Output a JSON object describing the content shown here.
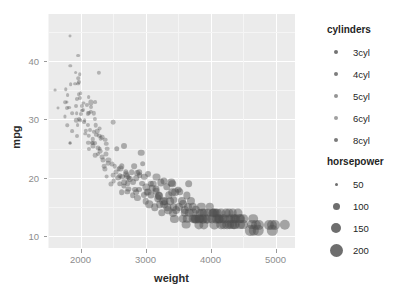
{
  "chart_data": {
    "type": "scatter",
    "title": "",
    "xlabel": "weight",
    "ylabel": "mpg",
    "xlim": [
      1500,
      5300
    ],
    "ylim": [
      8,
      48
    ],
    "xticks": [
      2000,
      3000,
      4000,
      5000
    ],
    "yticks": [
      10,
      20,
      30,
      40
    ],
    "grid": true,
    "panel_background": "#ebebeb",
    "gridline_color": "#ffffff",
    "point_color": "#505050",
    "point_opacity": 0.42,
    "legends": [
      {
        "title": "cylinders",
        "position": "right-top",
        "encoding": "color",
        "entries": [
          {
            "label": "3cyl",
            "color": "#737373",
            "size": 4
          },
          {
            "label": "4cyl",
            "color": "#7d7d7d",
            "size": 4
          },
          {
            "label": "5cyl",
            "color": "#949494",
            "size": 4
          },
          {
            "label": "6cyl",
            "color": "#a0a0a0",
            "size": 4
          },
          {
            "label": "8cyl",
            "color": "#7a7a7a",
            "size": 4
          }
        ]
      },
      {
        "title": "horsepower",
        "position": "right-bottom",
        "encoding": "size",
        "entries": [
          {
            "label": "50",
            "value": 50,
            "size": 3
          },
          {
            "label": "100",
            "value": 100,
            "size": 7
          },
          {
            "label": "150",
            "value": 150,
            "size": 10
          },
          {
            "label": "200",
            "value": 200,
            "size": 13
          }
        ]
      }
    ],
    "points": [
      [
        1613,
        35.0,
        4,
        46
      ],
      [
        1649,
        32.0,
        4,
        48
      ],
      [
        1755,
        30.5,
        4,
        52
      ],
      [
        1760,
        32.9,
        4,
        65
      ],
      [
        1773,
        35.1,
        4,
        60
      ],
      [
        1795,
        33.0,
        4,
        53
      ],
      [
        1795,
        31.9,
        4,
        71
      ],
      [
        1800,
        34.1,
        4,
        68
      ],
      [
        1825,
        32.0,
        4,
        67
      ],
      [
        1834,
        26.0,
        4,
        46
      ],
      [
        1835,
        26.0,
        4,
        46
      ],
      [
        1835,
        44.3,
        4,
        48
      ],
      [
        1845,
        39.1,
        4,
        58
      ],
      [
        1850,
        36.0,
        4,
        66
      ],
      [
        1867,
        31.0,
        4,
        65
      ],
      [
        1875,
        28.0,
        4,
        67
      ],
      [
        1915,
        36.1,
        4,
        66
      ],
      [
        1925,
        38.0,
        4,
        67
      ],
      [
        1937,
        32.2,
        4,
        70
      ],
      [
        1940,
        31.0,
        4,
        65
      ],
      [
        1945,
        33.5,
        4,
        75
      ],
      [
        1950,
        27.2,
        4,
        71
      ],
      [
        1955,
        29.0,
        4,
        68
      ],
      [
        1963,
        36.1,
        4,
        66
      ],
      [
        1965,
        40.9,
        4,
        67
      ],
      [
        1968,
        37.0,
        4,
        62
      ],
      [
        1970,
        34.3,
        4,
        65
      ],
      [
        1975,
        36.4,
        5,
        77
      ],
      [
        1980,
        30.0,
        4,
        68
      ],
      [
        1985,
        33.7,
        4,
        75
      ],
      [
        1990,
        37.7,
        4,
        62
      ],
      [
        1995,
        29.8,
        4,
        62
      ],
      [
        2000,
        34.5,
        4,
        65
      ],
      [
        2003,
        30.9,
        4,
        75
      ],
      [
        2019,
        32.3,
        4,
        75
      ],
      [
        2025,
        31.5,
        4,
        71
      ],
      [
        2035,
        31.6,
        4,
        74
      ],
      [
        2045,
        32.8,
        4,
        52
      ],
      [
        2050,
        29.5,
        4,
        68
      ],
      [
        2065,
        29.8,
        4,
        65
      ],
      [
        2075,
        27.5,
        4,
        60
      ],
      [
        2085,
        28.0,
        4,
        79
      ],
      [
        2100,
        32.4,
        4,
        75
      ],
      [
        2110,
        31.0,
        4,
        76
      ],
      [
        2120,
        29.0,
        4,
        75
      ],
      [
        2123,
        26.0,
        4,
        78
      ],
      [
        2124,
        25.0,
        4,
        75
      ],
      [
        2125,
        33.8,
        4,
        67
      ],
      [
        2130,
        27.2,
        4,
        84
      ],
      [
        2144,
        28.1,
        4,
        71
      ],
      [
        2155,
        31.3,
        4,
        80
      ],
      [
        2158,
        32.1,
        4,
        70
      ],
      [
        2164,
        32.9,
        4,
        100
      ],
      [
        2171,
        26.0,
        4,
        70
      ],
      [
        2188,
        26.0,
        4,
        72
      ],
      [
        2190,
        25.4,
        4,
        96
      ],
      [
        2200,
        27.9,
        4,
        78
      ],
      [
        2205,
        31.0,
        4,
        80
      ],
      [
        2219,
        30.0,
        4,
        76
      ],
      [
        2228,
        26.0,
        4,
        69
      ],
      [
        2230,
        23.9,
        4,
        86
      ],
      [
        2234,
        29.0,
        4,
        85
      ],
      [
        2245,
        27.4,
        4,
        80
      ],
      [
        2254,
        28.0,
        4,
        86
      ],
      [
        2264,
        25.1,
        4,
        92
      ],
      [
        2265,
        24.0,
        4,
        70
      ],
      [
        2278,
        38.0,
        4,
        78
      ],
      [
        2288,
        27.2,
        4,
        84
      ],
      [
        2295,
        25.0,
        4,
        87
      ],
      [
        2300,
        24.5,
        4,
        88
      ],
      [
        2310,
        26.8,
        4,
        88
      ],
      [
        2330,
        27.0,
        4,
        88
      ],
      [
        2335,
        23.6,
        4,
        90
      ],
      [
        2350,
        23.0,
        4,
        95
      ],
      [
        2360,
        22.0,
        4,
        88
      ],
      [
        2375,
        21.5,
        4,
        100
      ],
      [
        2379,
        26.5,
        4,
        88
      ],
      [
        2385,
        24.0,
        4,
        95
      ],
      [
        2395,
        25.8,
        4,
        83
      ],
      [
        2403,
        20.2,
        4,
        90
      ],
      [
        2408,
        25.0,
        4,
        87
      ],
      [
        2420,
        22.5,
        4,
        88
      ],
      [
        2430,
        23.0,
        4,
        97
      ],
      [
        2464,
        19.0,
        4,
        97
      ],
      [
        2490,
        22.3,
        4,
        95
      ],
      [
        2500,
        20.5,
        4,
        88
      ],
      [
        2506,
        29.5,
        4,
        88
      ],
      [
        2510,
        19.4,
        4,
        90
      ],
      [
        2525,
        22.0,
        4,
        85
      ],
      [
        2545,
        21.0,
        4,
        95
      ],
      [
        2560,
        25.0,
        6,
        105
      ],
      [
        2575,
        20.0,
        6,
        110
      ],
      [
        2585,
        21.5,
        4,
        90
      ],
      [
        2600,
        19.0,
        6,
        105
      ],
      [
        2605,
        20.3,
        5,
        103
      ],
      [
        2615,
        21.6,
        4,
        98
      ],
      [
        2634,
        17.5,
        6,
        110
      ],
      [
        2640,
        20.2,
        6,
        108
      ],
      [
        2665,
        25.4,
        6,
        116
      ],
      [
        2670,
        18.6,
        6,
        100
      ],
      [
        2672,
        19.2,
        6,
        105
      ],
      [
        2694,
        21.0,
        6,
        102
      ],
      [
        2700,
        20.6,
        6,
        108
      ],
      [
        2720,
        17.6,
        6,
        105
      ],
      [
        2725,
        19.1,
        6,
        110
      ],
      [
        2735,
        18.1,
        6,
        100
      ],
      [
        2740,
        20.0,
        6,
        110
      ],
      [
        2755,
        19.8,
        6,
        120
      ],
      [
        2789,
        21.0,
        6,
        110
      ],
      [
        2800,
        17.0,
        6,
        110
      ],
      [
        2807,
        19.2,
        6,
        115
      ],
      [
        2830,
        22.0,
        6,
        110
      ],
      [
        2835,
        18.0,
        6,
        115
      ],
      [
        2855,
        17.5,
        6,
        110
      ],
      [
        2860,
        19.9,
        6,
        110
      ],
      [
        2868,
        20.8,
        6,
        112
      ],
      [
        2875,
        16.5,
        6,
        120
      ],
      [
        2900,
        18.0,
        6,
        116
      ],
      [
        2904,
        21.0,
        6,
        110
      ],
      [
        2910,
        20.5,
        6,
        110
      ],
      [
        2933,
        24.3,
        6,
        130
      ],
      [
        2945,
        19.0,
        6,
        112
      ],
      [
        2957,
        22.4,
        6,
        110
      ],
      [
        2979,
        17.0,
        6,
        120
      ],
      [
        2984,
        20.2,
        6,
        125
      ],
      [
        3000,
        16.0,
        6,
        130
      ],
      [
        3012,
        18.5,
        6,
        145
      ],
      [
        3021,
        17.5,
        6,
        130
      ],
      [
        3035,
        20.6,
        6,
        115
      ],
      [
        3039,
        17.6,
        6,
        140
      ],
      [
        3060,
        15.5,
        8,
        150
      ],
      [
        3085,
        17.0,
        8,
        140
      ],
      [
        3102,
        18.2,
        6,
        130
      ],
      [
        3121,
        19.0,
        6,
        132
      ],
      [
        3139,
        15.0,
        8,
        150
      ],
      [
        3155,
        18.1,
        8,
        139
      ],
      [
        3169,
        20.2,
        6,
        140
      ],
      [
        3193,
        16.5,
        8,
        150
      ],
      [
        3205,
        17.0,
        8,
        145
      ],
      [
        3210,
        16.9,
        8,
        158
      ],
      [
        3221,
        15.5,
        8,
        150
      ],
      [
        3233,
        19.2,
        8,
        145
      ],
      [
        3250,
        14.0,
        8,
        150
      ],
      [
        3270,
        16.0,
        8,
        150
      ],
      [
        3278,
        19.4,
        8,
        140
      ],
      [
        3288,
        15.5,
        8,
        155
      ],
      [
        3302,
        16.0,
        8,
        148
      ],
      [
        3329,
        18.5,
        8,
        150
      ],
      [
        3336,
        15.0,
        8,
        150
      ],
      [
        3353,
        14.5,
        8,
        153
      ],
      [
        3360,
        17.0,
        8,
        150
      ],
      [
        3380,
        16.0,
        8,
        155
      ],
      [
        3399,
        19.2,
        8,
        145
      ],
      [
        3410,
        17.5,
        8,
        150
      ],
      [
        3425,
        14.0,
        8,
        160
      ],
      [
        3432,
        15.0,
        8,
        160
      ],
      [
        3439,
        16.2,
        8,
        150
      ],
      [
        3445,
        13.0,
        8,
        165
      ],
      [
        3459,
        17.5,
        8,
        155
      ],
      [
        3465,
        14.5,
        8,
        160
      ],
      [
        3504,
        18.0,
        8,
        130
      ],
      [
        3520,
        15.0,
        8,
        165
      ],
      [
        3530,
        17.6,
        8,
        150
      ],
      [
        3563,
        16.0,
        8,
        165
      ],
      [
        3570,
        13.0,
        8,
        170
      ],
      [
        3574,
        15.5,
        8,
        160
      ],
      [
        3609,
        14.0,
        8,
        170
      ],
      [
        3613,
        14.5,
        8,
        165
      ],
      [
        3620,
        12.0,
        8,
        180
      ],
      [
        3632,
        17.0,
        8,
        145
      ],
      [
        3645,
        13.0,
        8,
        175
      ],
      [
        3651,
        15.0,
        8,
        160
      ],
      [
        3664,
        19.0,
        8,
        155
      ],
      [
        3672,
        14.0,
        8,
        175
      ],
      [
        3693,
        16.0,
        8,
        165
      ],
      [
        3725,
        15.0,
        8,
        170
      ],
      [
        3730,
        13.0,
        8,
        175
      ],
      [
        3735,
        14.0,
        8,
        170
      ],
      [
        3755,
        13.0,
        8,
        180
      ],
      [
        3761,
        13.0,
        8,
        175
      ],
      [
        3777,
        14.5,
        8,
        170
      ],
      [
        3781,
        13.0,
        8,
        180
      ],
      [
        3820,
        12.0,
        8,
        190
      ],
      [
        3830,
        13.0,
        8,
        170
      ],
      [
        3840,
        14.0,
        8,
        165
      ],
      [
        3850,
        13.0,
        8,
        175
      ],
      [
        3860,
        15.0,
        8,
        170
      ],
      [
        3870,
        14.0,
        8,
        175
      ],
      [
        3880,
        13.0,
        8,
        180
      ],
      [
        3892,
        13.0,
        8,
        180
      ],
      [
        3900,
        12.0,
        8,
        190
      ],
      [
        3907,
        14.0,
        8,
        175
      ],
      [
        3940,
        13.0,
        8,
        180
      ],
      [
        3955,
        14.0,
        8,
        175
      ],
      [
        3962,
        13.0,
        8,
        180
      ],
      [
        3988,
        15.0,
        8,
        170
      ],
      [
        4020,
        13.0,
        8,
        190
      ],
      [
        4034,
        14.0,
        8,
        175
      ],
      [
        4042,
        14.0,
        8,
        180
      ],
      [
        4054,
        14.0,
        8,
        175
      ],
      [
        4060,
        12.0,
        8,
        190
      ],
      [
        4077,
        14.0,
        8,
        180
      ],
      [
        4080,
        13.0,
        8,
        185
      ],
      [
        4096,
        13.0,
        8,
        190
      ],
      [
        4100,
        14.0,
        8,
        175
      ],
      [
        4129,
        13.0,
        8,
        190
      ],
      [
        4135,
        13.0,
        8,
        190
      ],
      [
        4140,
        13.0,
        8,
        190
      ],
      [
        4154,
        14.0,
        8,
        185
      ],
      [
        4165,
        12.0,
        8,
        200
      ],
      [
        4190,
        13.0,
        8,
        195
      ],
      [
        4209,
        12.0,
        8,
        200
      ],
      [
        4215,
        13.0,
        8,
        190
      ],
      [
        4237,
        14.0,
        8,
        180
      ],
      [
        4257,
        12.0,
        8,
        200
      ],
      [
        4274,
        13.0,
        8,
        190
      ],
      [
        4278,
        14.0,
        8,
        185
      ],
      [
        4294,
        12.0,
        8,
        200
      ],
      [
        4312,
        13.0,
        8,
        195
      ],
      [
        4325,
        12.0,
        8,
        205
      ],
      [
        4341,
        14.0,
        8,
        180
      ],
      [
        4354,
        13.0,
        8,
        198
      ],
      [
        4363,
        12.0,
        8,
        200
      ],
      [
        4376,
        13.0,
        8,
        190
      ],
      [
        4380,
        12.0,
        8,
        205
      ],
      [
        4385,
        13.0,
        8,
        195
      ],
      [
        4422,
        14.0,
        8,
        185
      ],
      [
        4440,
        13.0,
        8,
        195
      ],
      [
        4457,
        12.0,
        8,
        205
      ],
      [
        4464,
        13.0,
        8,
        200
      ],
      [
        4499,
        12.0,
        8,
        205
      ],
      [
        4502,
        13.0,
        8,
        198
      ],
      [
        4615,
        11.0,
        8,
        210
      ],
      [
        4638,
        12.0,
        8,
        205
      ],
      [
        4654,
        13.0,
        8,
        200
      ],
      [
        4668,
        11.0,
        8,
        215
      ],
      [
        4699,
        12.0,
        8,
        210
      ],
      [
        4732,
        11.0,
        8,
        220
      ],
      [
        4746,
        12.0,
        8,
        208
      ],
      [
        4906,
        12.0,
        8,
        210
      ],
      [
        4951,
        11.0,
        8,
        215
      ],
      [
        4952,
        12.0,
        8,
        210
      ],
      [
        4997,
        12.0,
        8,
        208
      ],
      [
        5140,
        12.0,
        8,
        215
      ],
      [
        1795,
        29.0,
        4,
        60
      ],
      [
        2130,
        31.0,
        4,
        72
      ],
      [
        2295,
        28.4,
        4,
        90
      ],
      [
        2720,
        20.3,
        5,
        110
      ],
      [
        3085,
        19.0,
        6,
        125
      ],
      [
        3160,
        17.7,
        6,
        133
      ],
      [
        3410,
        19.0,
        8,
        150
      ],
      [
        3820,
        13.0,
        8,
        185
      ],
      [
        2190,
        26.6,
        4,
        82
      ],
      [
        2635,
        22.0,
        6,
        105
      ],
      [
        1937,
        29.8,
        4,
        78
      ],
      [
        2223,
        33.0,
        4,
        68
      ]
    ]
  }
}
